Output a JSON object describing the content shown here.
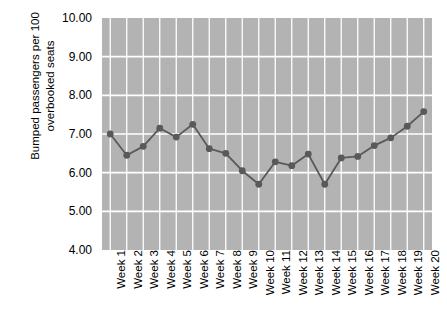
{
  "chart_data": {
    "type": "line",
    "title": "",
    "xlabel": "",
    "ylabel": "Bumped passengers per 100 overbooked seats",
    "ylabel_lines": [
      "Bumped passengers per 100",
      "overbooked seats"
    ],
    "categories": [
      "Week 1",
      "Week 2",
      "Week 3",
      "Week 4",
      "Week 5",
      "Week 6",
      "Week 7",
      "Week 8",
      "Week 9",
      "Week 10",
      "Week 11",
      "Week 12",
      "Week 13",
      "Week 14",
      "Week 15",
      "Week 16",
      "Week 17",
      "Week 18",
      "Week 19",
      "Week 20"
    ],
    "values": [
      7.0,
      6.45,
      6.68,
      7.15,
      6.92,
      7.25,
      6.62,
      6.5,
      6.05,
      5.7,
      6.28,
      6.18,
      6.48,
      5.7,
      6.38,
      6.42,
      6.7,
      6.9,
      7.2,
      7.58
    ],
    "ylim": [
      4.0,
      10.0
    ],
    "ytick_values": [
      10.0,
      9.0,
      8.0,
      7.0,
      6.0,
      5.0,
      4.0
    ],
    "ytick_labels": [
      "10.00",
      "9.00",
      "8.00",
      "7.00",
      "6.00",
      "5.00",
      "4.00"
    ],
    "grid": true,
    "grid_color": "#ffffff",
    "legend": null,
    "legend_position": "none",
    "plot_background": "#b3b3b3",
    "line_color": "#595959",
    "marker_color": "#595959",
    "marker_shape": "circle",
    "series": [
      {
        "name": "Bumped passengers per 100 overbooked seats",
        "values": [
          7.0,
          6.45,
          6.68,
          7.15,
          6.92,
          7.25,
          6.62,
          6.5,
          6.05,
          5.7,
          6.28,
          6.18,
          6.48,
          5.7,
          6.38,
          6.42,
          6.7,
          6.9,
          7.2,
          7.58
        ]
      }
    ]
  }
}
